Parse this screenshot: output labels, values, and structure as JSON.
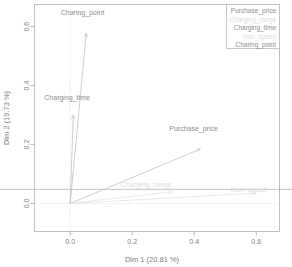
{
  "chart_data": {
    "type": "scatter",
    "title": "",
    "subtitle": "",
    "xlabel": "Dim 1 (20.81 %)",
    "ylabel": "Dim 2 (19.73 %)",
    "xlim": [
      -0.115,
      0.675
    ],
    "ylim": [
      -0.095,
      0.675
    ],
    "xticks": [
      "0.0",
      "0.2",
      "0.4",
      "0.6"
    ],
    "xtick_values": [
      0.0,
      0.2,
      0.4,
      0.6
    ],
    "yticks": [
      "0.0",
      "0.2",
      "0.4",
      "0.6"
    ],
    "ytick_values": [
      0.0,
      0.2,
      0.4,
      0.6
    ],
    "grid": false,
    "origin": [
      0.0,
      0.0
    ],
    "guides": {
      "vertical_at_x": 0.0,
      "horizontal_at_y": 0.0
    },
    "legend_position": "top-right",
    "vectors": [
      {
        "name": "Charing_point",
        "x": 0.052,
        "y": 0.578,
        "label": "Charing_point",
        "label_x": 0.04,
        "label_y": 0.64,
        "faint": false
      },
      {
        "name": "Charging_time",
        "x": 0.01,
        "y": 0.3,
        "label": "Charging_time",
        "label_x": -0.01,
        "label_y": 0.352,
        "faint": false
      },
      {
        "name": "Purchase_price",
        "x": 0.42,
        "y": 0.185,
        "label": "Purchase_price",
        "label_x": 0.398,
        "label_y": 0.245,
        "faint": false
      },
      {
        "name": "Charging_range",
        "x": 0.33,
        "y": 0.04,
        "label": "Charging_range",
        "label_x": 0.245,
        "label_y": 0.055,
        "faint": true
      },
      {
        "name": "Max_speed",
        "x": 0.6,
        "y": 0.035,
        "label": "Max_speed",
        "label_x": 0.575,
        "label_y": 0.04,
        "faint": true
      }
    ],
    "legend_entries": [
      {
        "label": "Purchase_price",
        "faint": false
      },
      {
        "label": "Charging_range",
        "faint": true
      },
      {
        "label": "Charging_time",
        "faint": false
      },
      {
        "label": "Max_speed",
        "faint": true
      },
      {
        "label": "Charing_point",
        "faint": false
      }
    ]
  }
}
